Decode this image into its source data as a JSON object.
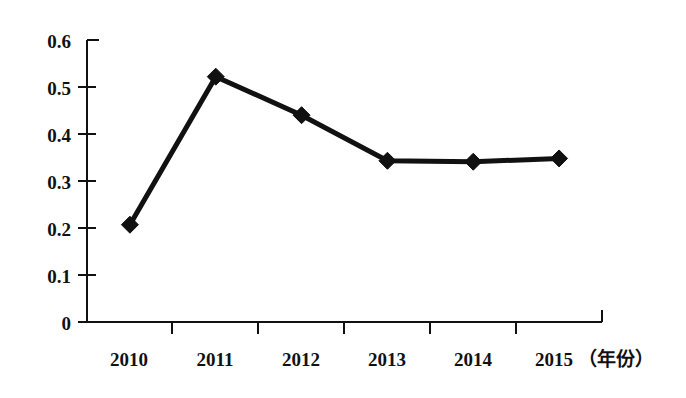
{
  "chart_data": {
    "type": "line",
    "title": "",
    "subtitle": "",
    "xlabel": "（年份）",
    "ylabel": "",
    "categories": [
      "2010",
      "2011",
      "2012",
      "2013",
      "2014",
      "2015"
    ],
    "values": [
      0.207,
      0.522,
      0.44,
      0.343,
      0.341,
      0.348
    ],
    "series": [
      {
        "name": "",
        "values": [
          0.207,
          0.522,
          0.44,
          0.343,
          0.341,
          0.348
        ]
      }
    ],
    "x": [
      "2010",
      "2011",
      "2012",
      "2013",
      "2014",
      "2015"
    ],
    "ylim": [
      0,
      0.6
    ],
    "ytick_labels": [
      "0.6",
      "0.5",
      "0.4",
      "0.3",
      "0.2",
      "0.1",
      "0"
    ],
    "ytick_values": [
      0.6,
      0.5,
      0.4,
      0.3,
      0.2,
      0.1,
      0
    ],
    "xtick_labels": [
      "2010",
      "2011",
      "2012",
      "2013",
      "2014",
      "2015"
    ],
    "grid": false,
    "legend": "none",
    "marker": "diamond",
    "line_color": "#111111",
    "marker_color": "#111111",
    "background_color": "#ffffff",
    "annotations": []
  },
  "axis": {
    "x_unit_suffix": "（年份）"
  }
}
